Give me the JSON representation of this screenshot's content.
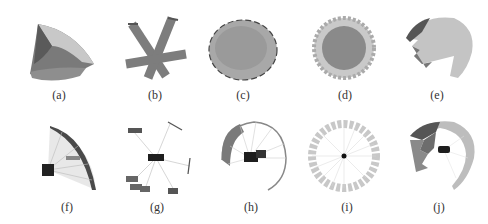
{
  "figure": {
    "panels": [
      {
        "id": "a",
        "label": "(a)",
        "depicts": "textured curved surface patch"
      },
      {
        "id": "b",
        "label": "(b)",
        "depicts": "star-shaped textured strips"
      },
      {
        "id": "c",
        "label": "(c)",
        "depicts": "textured disk"
      },
      {
        "id": "d",
        "label": "(d)",
        "depicts": "textured disk with jagged rim"
      },
      {
        "id": "e",
        "label": "(e)",
        "depicts": "partial textured hemisphere with sawtooth edge"
      },
      {
        "id": "f",
        "label": "(f)",
        "depicts": "camera with rays onto curved wall"
      },
      {
        "id": "g",
        "label": "(g)",
        "depicts": "camera with rays to scattered fragments"
      },
      {
        "id": "h",
        "label": "(h)",
        "depicts": "camera inside partial ring with rays"
      },
      {
        "id": "i",
        "label": "(i)",
        "depicts": "central point with radial rays to ring"
      },
      {
        "id": "j",
        "label": "(j)",
        "depicts": "camera inside partial sphere with patches"
      }
    ]
  }
}
